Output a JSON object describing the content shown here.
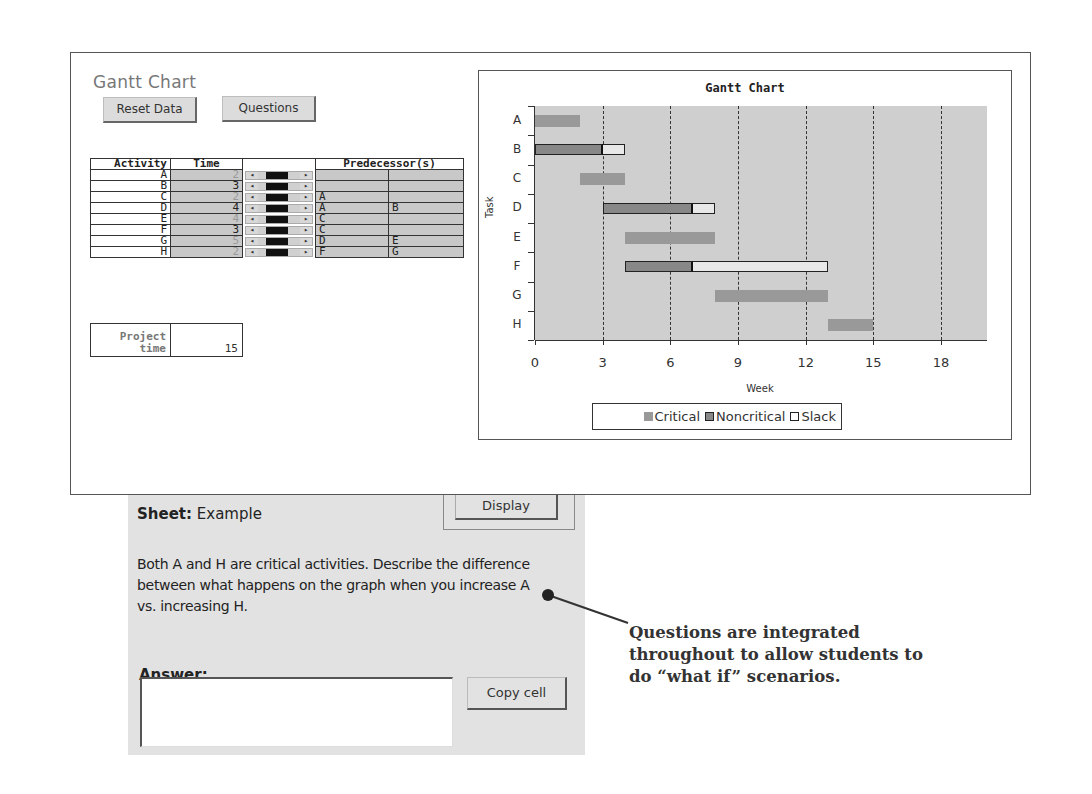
{
  "app": {
    "title": "Gantt Chart",
    "buttons": {
      "reset": "Reset Data",
      "questions": "Questions"
    }
  },
  "table": {
    "headers": {
      "activity": "Activity",
      "time": "Time",
      "predecessors": "Predecessor(s)"
    },
    "rows": [
      {
        "activity": "A",
        "time": "2",
        "critical": true,
        "pred1": "",
        "pred2": ""
      },
      {
        "activity": "B",
        "time": "3",
        "critical": false,
        "pred1": "",
        "pred2": ""
      },
      {
        "activity": "C",
        "time": "2",
        "critical": true,
        "pred1": "A",
        "pred2": ""
      },
      {
        "activity": "D",
        "time": "4",
        "critical": false,
        "pred1": "A",
        "pred2": "B"
      },
      {
        "activity": "E",
        "time": "4",
        "critical": true,
        "pred1": "C",
        "pred2": ""
      },
      {
        "activity": "F",
        "time": "3",
        "critical": false,
        "pred1": "C",
        "pred2": ""
      },
      {
        "activity": "G",
        "time": "5",
        "critical": true,
        "pred1": "D",
        "pred2": "E"
      },
      {
        "activity": "H",
        "time": "2",
        "critical": true,
        "pred1": "F",
        "pred2": "G"
      }
    ],
    "spinner_icons": {
      "left": "◂",
      "right": "▸"
    },
    "project_time": {
      "label_line1": "Project",
      "label_line2": "time",
      "value": "15"
    }
  },
  "chart_data": {
    "type": "bar",
    "orientation": "horizontal-gantt",
    "title": "Gantt Chart",
    "xlabel": "Week",
    "ylabel": "Task",
    "xlim": [
      0,
      20
    ],
    "xticks": [
      0,
      3,
      6,
      9,
      12,
      15,
      18
    ],
    "grid": "vertical dashed at each x tick",
    "categories": [
      "A",
      "B",
      "C",
      "D",
      "E",
      "F",
      "G",
      "H"
    ],
    "tasks": [
      {
        "task": "A",
        "start": 0,
        "duration": 2,
        "type": "Critical",
        "slack": 0
      },
      {
        "task": "B",
        "start": 0,
        "duration": 3,
        "type": "Noncritical",
        "slack": 1
      },
      {
        "task": "C",
        "start": 2,
        "duration": 2,
        "type": "Critical",
        "slack": 0
      },
      {
        "task": "D",
        "start": 3,
        "duration": 4,
        "type": "Noncritical",
        "slack": 1
      },
      {
        "task": "E",
        "start": 4,
        "duration": 4,
        "type": "Critical",
        "slack": 0
      },
      {
        "task": "F",
        "start": 4,
        "duration": 3,
        "type": "Noncritical",
        "slack": 6
      },
      {
        "task": "G",
        "start": 8,
        "duration": 5,
        "type": "Critical",
        "slack": 0
      },
      {
        "task": "H",
        "start": 13,
        "duration": 2,
        "type": "Critical",
        "slack": 0
      }
    ],
    "legend": [
      "Critical",
      "Noncritical",
      "Slack"
    ],
    "legend_position": "bottom",
    "colors": {
      "critical": "#999999",
      "noncritical": "#888888",
      "slack": "#e8e8e8",
      "plot_bg": "#cfcfcf"
    }
  },
  "question_panel": {
    "sheet_label": "Sheet:",
    "sheet_name": "Example",
    "display_button": "Display",
    "question": "Both A and H are critical activities. Describe the difference between what happens on the graph when you increase A vs. increasing H.",
    "answer_label": "Answer:",
    "answer_value": "",
    "copy_button": "Copy cell"
  },
  "annotation": {
    "text": "Questions are integrated throughout to allow students to do “what if” scenarios."
  }
}
